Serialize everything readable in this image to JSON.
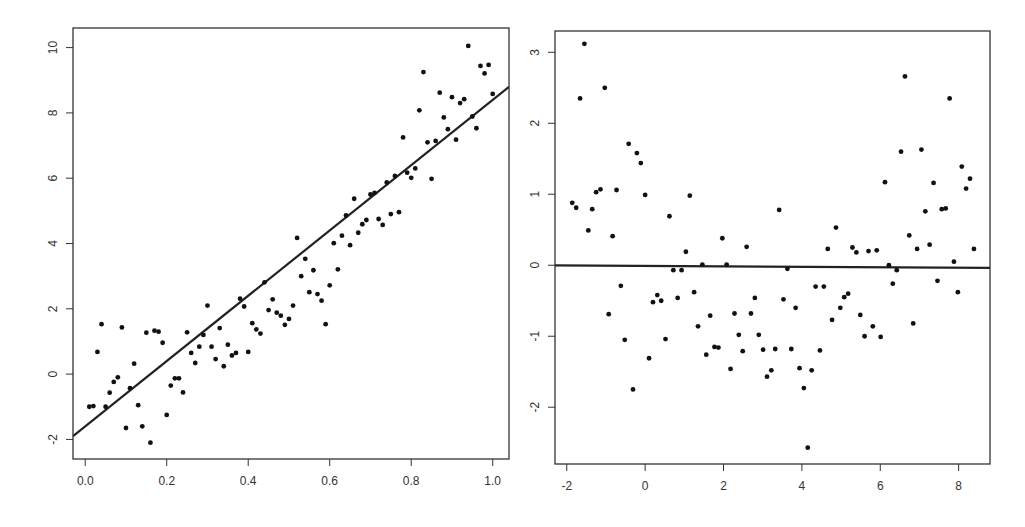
{
  "colors": {
    "background": "#ffffff",
    "axis": "#333333",
    "points": "#111111",
    "line": "#222222"
  },
  "chart_data": [
    {
      "type": "scatter",
      "title": "",
      "xlabel": "",
      "ylabel": "",
      "xlim": [
        -0.03,
        1.04
      ],
      "ylim": [
        -2.6,
        10.6
      ],
      "grid": false,
      "legend": null,
      "box": {
        "left": 73,
        "top": 28,
        "right": 509,
        "bottom": 459
      },
      "x_ticks": [
        0.0,
        0.2,
        0.4,
        0.6,
        0.8,
        1.0
      ],
      "x_tick_labels": [
        "0.0",
        "0.2",
        "0.4",
        "0.6",
        "0.8",
        "1.0"
      ],
      "y_ticks": [
        -2,
        0,
        2,
        4,
        6,
        8,
        10
      ],
      "y_tick_labels": [
        "-2",
        "0",
        "2",
        "4",
        "6",
        "8",
        "10"
      ],
      "fit_line": {
        "intercept": -1.6,
        "slope": 10.0,
        "label": "regression line"
      },
      "points": [
        [
          0.01,
          -1.0
        ],
        [
          0.02,
          -0.98
        ],
        [
          0.03,
          0.68
        ],
        [
          0.04,
          1.53
        ],
        [
          0.05,
          -1.0
        ],
        [
          0.06,
          -0.57
        ],
        [
          0.07,
          -0.24
        ],
        [
          0.08,
          -0.1
        ],
        [
          0.09,
          1.43
        ],
        [
          0.1,
          -1.65
        ],
        [
          0.11,
          -0.43
        ],
        [
          0.12,
          0.32
        ],
        [
          0.13,
          -0.95
        ],
        [
          0.14,
          -1.6
        ],
        [
          0.15,
          1.27
        ],
        [
          0.16,
          -2.1
        ],
        [
          0.17,
          1.33
        ],
        [
          0.18,
          1.3
        ],
        [
          0.19,
          0.96
        ],
        [
          0.2,
          -1.25
        ],
        [
          0.21,
          -0.35
        ],
        [
          0.22,
          -0.13
        ],
        [
          0.23,
          -0.13
        ],
        [
          0.24,
          -0.56
        ],
        [
          0.25,
          1.28
        ],
        [
          0.26,
          0.65
        ],
        [
          0.27,
          0.34
        ],
        [
          0.28,
          0.84
        ],
        [
          0.29,
          1.2
        ],
        [
          0.3,
          2.1
        ],
        [
          0.31,
          0.84
        ],
        [
          0.32,
          0.46
        ],
        [
          0.33,
          1.41
        ],
        [
          0.34,
          0.24
        ],
        [
          0.35,
          0.9
        ],
        [
          0.36,
          0.57
        ],
        [
          0.37,
          0.65
        ],
        [
          0.38,
          2.31
        ],
        [
          0.39,
          2.07
        ],
        [
          0.4,
          0.68
        ],
        [
          0.41,
          1.56
        ],
        [
          0.42,
          1.37
        ],
        [
          0.43,
          1.24
        ],
        [
          0.44,
          2.81
        ],
        [
          0.45,
          1.96
        ],
        [
          0.46,
          2.29
        ],
        [
          0.47,
          1.88
        ],
        [
          0.48,
          1.79
        ],
        [
          0.49,
          1.51
        ],
        [
          0.5,
          1.69
        ],
        [
          0.51,
          2.1
        ],
        [
          0.52,
          4.17
        ],
        [
          0.53,
          3.0
        ],
        [
          0.54,
          3.53
        ],
        [
          0.55,
          2.51
        ],
        [
          0.56,
          3.18
        ],
        [
          0.57,
          2.45
        ],
        [
          0.58,
          2.25
        ],
        [
          0.59,
          1.53
        ],
        [
          0.6,
          2.72
        ],
        [
          0.61,
          4.01
        ],
        [
          0.62,
          3.21
        ],
        [
          0.63,
          4.24
        ],
        [
          0.64,
          4.86
        ],
        [
          0.65,
          3.95
        ],
        [
          0.66,
          5.37
        ],
        [
          0.67,
          4.33
        ],
        [
          0.68,
          4.59
        ],
        [
          0.69,
          4.72
        ],
        [
          0.7,
          5.5
        ],
        [
          0.71,
          5.55
        ],
        [
          0.72,
          4.75
        ],
        [
          0.73,
          4.57
        ],
        [
          0.74,
          5.87
        ],
        [
          0.75,
          4.9
        ],
        [
          0.76,
          6.07
        ],
        [
          0.77,
          4.96
        ],
        [
          0.78,
          7.25
        ],
        [
          0.79,
          6.17
        ],
        [
          0.8,
          6.01
        ],
        [
          0.81,
          6.3
        ],
        [
          0.82,
          8.08
        ],
        [
          0.83,
          9.25
        ],
        [
          0.84,
          7.1
        ],
        [
          0.85,
          5.98
        ],
        [
          0.86,
          7.14
        ],
        [
          0.87,
          8.62
        ],
        [
          0.88,
          7.86
        ],
        [
          0.89,
          7.5
        ],
        [
          0.9,
          8.48
        ],
        [
          0.91,
          7.18
        ],
        [
          0.92,
          8.3
        ],
        [
          0.93,
          8.42
        ],
        [
          0.94,
          10.05
        ],
        [
          0.95,
          7.89
        ],
        [
          0.96,
          7.53
        ],
        [
          0.97,
          9.44
        ],
        [
          0.98,
          9.21
        ],
        [
          0.99,
          9.47
        ],
        [
          1.0,
          8.58
        ]
      ]
    },
    {
      "type": "scatter",
      "title": "",
      "xlabel": "",
      "ylabel": "",
      "xlim": [
        -2.3,
        8.8
      ],
      "ylim": [
        -2.8,
        3.3
      ],
      "grid": false,
      "legend": null,
      "box": {
        "left": 555,
        "top": 31,
        "right": 990,
        "bottom": 464
      },
      "x_ticks": [
        -2,
        0,
        2,
        4,
        6,
        8
      ],
      "x_tick_labels": [
        "-2",
        "0",
        "2",
        "4",
        "6",
        "8"
      ],
      "y_ticks": [
        -2,
        -1,
        0,
        1,
        2,
        3
      ],
      "y_tick_labels": [
        "-2",
        "-1",
        "0",
        "1",
        "2",
        "3"
      ],
      "fit_line": {
        "intercept": -0.01,
        "slope": -0.003,
        "label": "zero reference line"
      },
      "points": [
        [
          -1.86,
          0.88
        ],
        [
          -1.76,
          0.81
        ],
        [
          -1.66,
          2.35
        ],
        [
          -1.55,
          3.12
        ],
        [
          -1.45,
          0.49
        ],
        [
          -1.35,
          0.79
        ],
        [
          -1.25,
          1.03
        ],
        [
          -1.14,
          1.07
        ],
        [
          -1.03,
          2.5
        ],
        [
          -0.93,
          -0.69
        ],
        [
          -0.83,
          0.41
        ],
        [
          -0.73,
          1.06
        ],
        [
          -0.62,
          -0.29
        ],
        [
          -0.52,
          -1.05
        ],
        [
          -0.42,
          1.71
        ],
        [
          -0.31,
          -1.75
        ],
        [
          -0.21,
          1.58
        ],
        [
          -0.11,
          1.44
        ],
        [
          0.0,
          0.99
        ],
        [
          0.1,
          -1.31
        ],
        [
          0.2,
          -0.52
        ],
        [
          0.31,
          -0.42
        ],
        [
          0.41,
          -0.5
        ],
        [
          0.52,
          -1.04
        ],
        [
          0.62,
          0.69
        ],
        [
          0.72,
          -0.07
        ],
        [
          0.83,
          -0.46
        ],
        [
          0.93,
          -0.07
        ],
        [
          1.04,
          0.19
        ],
        [
          1.14,
          0.98
        ],
        [
          1.25,
          -0.38
        ],
        [
          1.35,
          -0.86
        ],
        [
          1.46,
          0.01
        ],
        [
          1.56,
          -1.26
        ],
        [
          1.66,
          -0.71
        ],
        [
          1.77,
          -1.15
        ],
        [
          1.87,
          -1.16
        ],
        [
          1.97,
          0.38
        ],
        [
          2.08,
          0.01
        ],
        [
          2.18,
          -1.46
        ],
        [
          2.28,
          -0.68
        ],
        [
          2.39,
          -0.98
        ],
        [
          2.49,
          -1.21
        ],
        [
          2.59,
          0.26
        ],
        [
          2.7,
          -0.68
        ],
        [
          2.8,
          -0.46
        ],
        [
          2.9,
          -0.98
        ],
        [
          3.01,
          -1.19
        ],
        [
          3.11,
          -1.57
        ],
        [
          3.22,
          -1.48
        ],
        [
          3.32,
          -1.18
        ],
        [
          3.42,
          0.78
        ],
        [
          3.53,
          -0.48
        ],
        [
          3.63,
          -0.05
        ],
        [
          3.73,
          -1.18
        ],
        [
          3.84,
          -0.6
        ],
        [
          3.94,
          -1.45
        ],
        [
          4.05,
          -1.73
        ],
        [
          4.15,
          -2.57
        ],
        [
          4.25,
          -1.48
        ],
        [
          4.35,
          -0.3
        ],
        [
          4.46,
          -1.2
        ],
        [
          4.56,
          -0.3
        ],
        [
          4.66,
          0.23
        ],
        [
          4.77,
          -0.77
        ],
        [
          4.87,
          0.53
        ],
        [
          4.98,
          -0.6
        ],
        [
          5.08,
          -0.45
        ],
        [
          5.18,
          -0.4
        ],
        [
          5.29,
          0.25
        ],
        [
          5.39,
          0.18
        ],
        [
          5.49,
          -0.7
        ],
        [
          5.6,
          -1.0
        ],
        [
          5.7,
          0.2
        ],
        [
          5.81,
          -0.86
        ],
        [
          5.91,
          0.21
        ],
        [
          6.01,
          -1.01
        ],
        [
          6.12,
          1.17
        ],
        [
          6.22,
          0.0
        ],
        [
          6.32,
          -0.26
        ],
        [
          6.42,
          -0.07
        ],
        [
          6.53,
          1.6
        ],
        [
          6.63,
          2.66
        ],
        [
          6.74,
          0.42
        ],
        [
          6.84,
          -0.82
        ],
        [
          6.94,
          0.23
        ],
        [
          7.05,
          1.63
        ],
        [
          7.15,
          0.76
        ],
        [
          7.26,
          0.29
        ],
        [
          7.36,
          1.16
        ],
        [
          7.46,
          -0.22
        ],
        [
          7.57,
          0.79
        ],
        [
          7.67,
          0.8
        ],
        [
          7.77,
          2.35
        ],
        [
          7.88,
          0.05
        ],
        [
          7.98,
          -0.38
        ],
        [
          8.08,
          1.39
        ],
        [
          8.19,
          1.08
        ],
        [
          8.29,
          1.22
        ],
        [
          8.39,
          0.23
        ]
      ]
    }
  ]
}
